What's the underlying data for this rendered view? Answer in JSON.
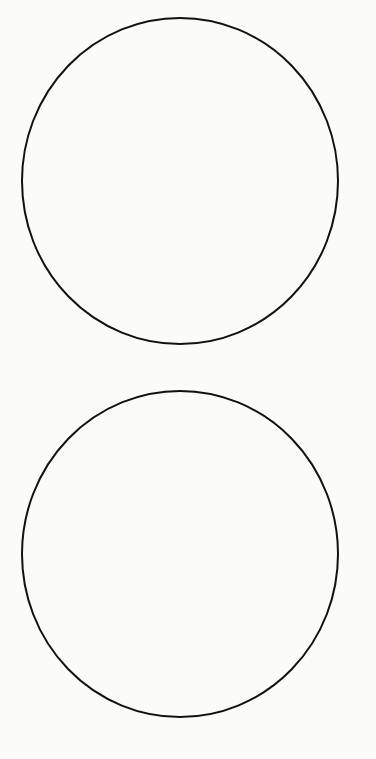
{
  "diagram": {
    "background_color": "#fbfbfa",
    "stroke_color": "#111111",
    "stroke_width": 2,
    "shapes": [
      {
        "name": "top-circle",
        "cx": 180,
        "cy": 181,
        "rx": 158,
        "ry": 163
      },
      {
        "name": "bottom-circle",
        "cx": 180,
        "cy": 554,
        "rx": 158,
        "ry": 163
      }
    ]
  }
}
